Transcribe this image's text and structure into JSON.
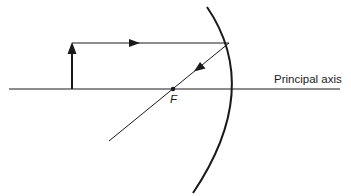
{
  "diagram": {
    "type": "concave mirror ray diagram",
    "labels": {
      "principal_axis": "Principal axis",
      "focal_point": "F"
    },
    "colors": {
      "line": "#1a1a1a",
      "background": "#ffffff"
    },
    "elements": [
      {
        "name": "principal-axis",
        "kind": "line"
      },
      {
        "name": "object-arrow",
        "kind": "arrow",
        "direction": "up"
      },
      {
        "name": "incident-ray",
        "kind": "ray",
        "direction": "right",
        "parallel_to_axis": true
      },
      {
        "name": "reflected-ray",
        "kind": "ray",
        "passes_through": "F"
      },
      {
        "name": "concave-mirror",
        "kind": "arc"
      },
      {
        "name": "focal-point",
        "kind": "dot"
      }
    ]
  }
}
